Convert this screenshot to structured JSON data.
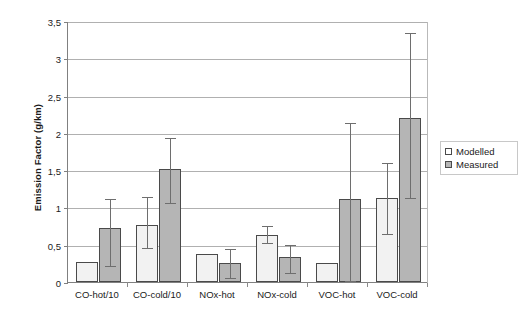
{
  "chart_data": {
    "type": "bar",
    "title": "",
    "xlabel": "",
    "ylabel": "Emission Factor (g/km)",
    "ylim": [
      0,
      3.5
    ],
    "ytick_labels": [
      "0",
      "0,5",
      "1",
      "1,5",
      "2",
      "2,5",
      "3",
      "3,5"
    ],
    "ytick_values": [
      0,
      0.5,
      1,
      1.5,
      2,
      2.5,
      3,
      3.5
    ],
    "grid": true,
    "legend_position": "right",
    "decimal_separator": ",",
    "categories": [
      "CO-hot/10",
      "CO-cold/10",
      "NOx-hot",
      "NOx-cold",
      "VOC-hot",
      "VOC-cold"
    ],
    "series": [
      {
        "name": "Modelled",
        "color": "#f2f2f2",
        "values": [
          0.27,
          0.77,
          0.38,
          0.63,
          0.26,
          1.12
        ],
        "error_low": [
          null,
          0.45,
          null,
          0.52,
          null,
          0.65
        ],
        "error_high": [
          null,
          1.14,
          null,
          0.75,
          null,
          1.6
        ]
      },
      {
        "name": "Measured",
        "color": "#b5b5b5",
        "values": [
          0.72,
          1.52,
          0.25,
          0.33,
          1.11,
          2.2
        ],
        "error_low": [
          0.22,
          1.06,
          0.05,
          0.12,
          0.02,
          1.12
        ],
        "error_high": [
          1.11,
          1.93,
          0.44,
          0.5,
          2.13,
          3.34
        ]
      }
    ]
  },
  "legend": {
    "items": [
      {
        "label": "Modelled",
        "swatch": "modelled"
      },
      {
        "label": "Measured",
        "swatch": "measured"
      }
    ]
  }
}
